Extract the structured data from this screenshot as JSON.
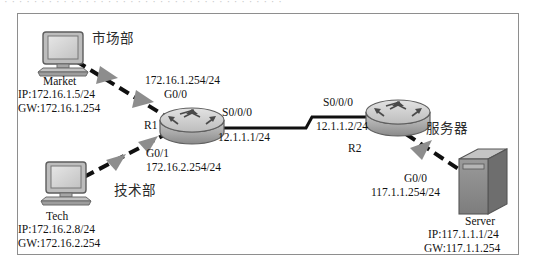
{
  "page": {
    "scrap_text_top": "· · · · · · · · · · · · · · · · · · · · · · · · · · · · · · · · · · · · · ·"
  },
  "diagram": {
    "title_hidden": "",
    "nodes": [
      {
        "id": "market-pc",
        "type": "pc",
        "department": "市场部",
        "name": "Market",
        "ip": "IP:172.16.1.5/24",
        "gateway": "GW:172.16.1.254"
      },
      {
        "id": "tech-pc",
        "type": "pc",
        "department": "技术部",
        "name": "Tech",
        "ip": "IP:172.16.2.8/24",
        "gateway": "GW:172.16.2.254"
      },
      {
        "id": "r1",
        "type": "router",
        "name": "R1"
      },
      {
        "id": "r2",
        "type": "router",
        "name": "R2"
      },
      {
        "id": "server",
        "type": "server",
        "department": "服务器",
        "name": "Server",
        "ip": "IP:117.1.1.1/24",
        "gateway": "GW:117.1.1.254"
      }
    ],
    "interfaces": {
      "r1_g0_0_ip": "172.16.1.254/24",
      "r1_g0_0_name": "G0/0",
      "r1_g0_1_name": "G0/1",
      "r1_g0_1_ip": "172.16.2.254/24",
      "r1_s0_0_0_name": "S0/0/0",
      "r1_s0_0_0_ip": "12.1.1.1/24",
      "r2_s0_0_0_name": "S0/0/0",
      "r2_s0_0_0_ip": "12.1.1.2/24",
      "r2_g0_0_name": "G0/0",
      "r2_g0_0_ip": "117.1.1.254/24"
    },
    "links": [
      {
        "id": "market-r1",
        "style": "dashed",
        "from": "market-pc",
        "to": "r1"
      },
      {
        "id": "tech-r1",
        "style": "dashed",
        "from": "tech-pc",
        "to": "r1"
      },
      {
        "id": "r1-r2",
        "style": "solid",
        "from": "r1",
        "to": "r2"
      },
      {
        "id": "r2-server",
        "style": "dashed",
        "from": "r2",
        "to": "server"
      }
    ],
    "colors": {
      "frame_border": "#8e8e8e",
      "link": "#101010",
      "arrow_marker": "#8d8d8d",
      "device_body": "#b9b9b9",
      "device_dark": "#6f6f6f",
      "device_light": "#d8d8d8",
      "text": "#121212"
    }
  }
}
